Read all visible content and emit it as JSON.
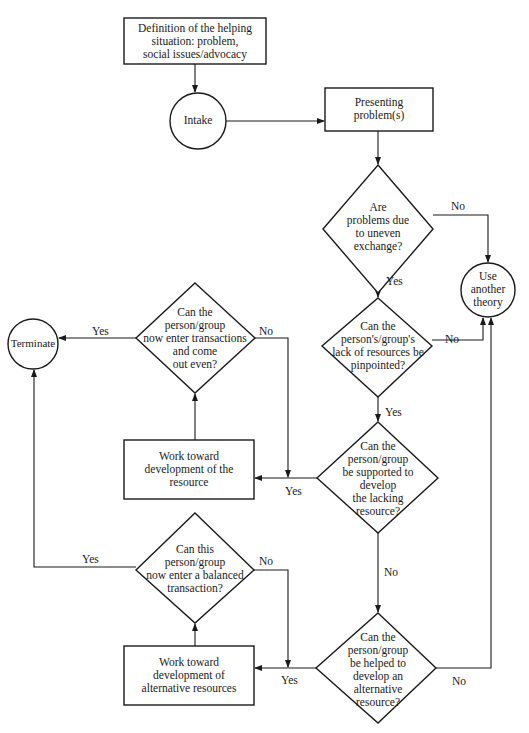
{
  "diagram": {
    "type": "flowchart",
    "nodes": {
      "definition": {
        "shape": "rect",
        "text": "Definition of the helping\nsituation: problem,\nsocial issues/advocacy"
      },
      "intake": {
        "shape": "circle",
        "text": "Intake"
      },
      "presenting": {
        "shape": "rect",
        "text": "Presenting\nproblem(s)"
      },
      "q_uneven": {
        "shape": "diamond",
        "text": "Are\nproblems due\nto uneven\nexchange?"
      },
      "use_other": {
        "shape": "circle",
        "text": "Use\nanother\ntheory"
      },
      "q_pinpoint": {
        "shape": "diamond",
        "text": "Can the\nperson's/group's\nlack of resources be\npinpointed?"
      },
      "q_supported": {
        "shape": "diamond",
        "text": "Can the\nperson/group\nbe supported to\ndevelop\nthe lacking\nresource?"
      },
      "work_resource": {
        "shape": "rect",
        "text": "Work toward\ndevelopment of the\nresource"
      },
      "q_out_even": {
        "shape": "diamond",
        "text": "Can the\nperson/group\nnow enter transactions\nand come\nout even?"
      },
      "terminate": {
        "shape": "circle",
        "text": "Terminate"
      },
      "q_alternative": {
        "shape": "diamond",
        "text": "Can the\nperson/group\nbe helped to\ndevelop an\nalternative\nresource?"
      },
      "work_alternative": {
        "shape": "rect",
        "text": "Work toward\ndevelopment of\nalternative resources"
      },
      "q_balanced": {
        "shape": "diamond",
        "text": "Can this\nperson/group\nnow enter a balanced\ntransaction?"
      }
    },
    "edges": [
      {
        "from": "definition",
        "to": "intake",
        "label": ""
      },
      {
        "from": "intake",
        "to": "presenting",
        "label": ""
      },
      {
        "from": "presenting",
        "to": "q_uneven",
        "label": ""
      },
      {
        "from": "q_uneven",
        "to": "use_other",
        "label": "No"
      },
      {
        "from": "q_uneven",
        "to": "q_pinpoint",
        "label": "Yes"
      },
      {
        "from": "q_pinpoint",
        "to": "use_other",
        "label": "No"
      },
      {
        "from": "q_pinpoint",
        "to": "q_supported",
        "label": "Yes"
      },
      {
        "from": "q_supported",
        "to": "work_resource",
        "label": "Yes"
      },
      {
        "from": "q_supported",
        "to": "q_alternative",
        "label": "No"
      },
      {
        "from": "work_resource",
        "to": "q_out_even",
        "label": ""
      },
      {
        "from": "q_out_even",
        "to": "terminate",
        "label": "Yes"
      },
      {
        "from": "q_out_even",
        "to": "work_resource",
        "label": "No"
      },
      {
        "from": "q_alternative",
        "to": "work_alternative",
        "label": "Yes"
      },
      {
        "from": "q_alternative",
        "to": "use_other",
        "label": "No"
      },
      {
        "from": "work_alternative",
        "to": "q_balanced",
        "label": ""
      },
      {
        "from": "q_balanced",
        "to": "terminate",
        "label": "Yes"
      },
      {
        "from": "q_balanced",
        "to": "work_alternative",
        "label": "No"
      }
    ],
    "edge_labels": {
      "uneven_no": "No",
      "uneven_yes": "Yes",
      "pinpoint_no": "No",
      "pinpoint_yes": "Yes",
      "supported_yes": "Yes",
      "supported_no": "No",
      "out_even_yes": "Yes",
      "out_even_no": "No",
      "alternative_yes": "Yes",
      "alternative_no": "No",
      "balanced_yes": "Yes",
      "balanced_no": "No"
    }
  }
}
